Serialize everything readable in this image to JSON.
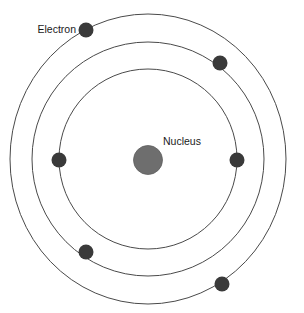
{
  "diagram": {
    "type": "atomic-structure-diagram",
    "canvas": {
      "width": 304,
      "height": 313,
      "background": "#ffffff"
    },
    "center": {
      "x": 148,
      "y": 159
    },
    "colors": {
      "orbit_stroke": "#4a4a4a",
      "nucleus_fill": "#6e6e6e",
      "nucleus_stroke": "#5f5f5f",
      "electron_fill": "#3a3a3a",
      "label_text": "#1a1a1a",
      "background": "#ffffff"
    },
    "labels": [
      {
        "id": "electron-label",
        "text": "Electron",
        "x": 76,
        "y": 30,
        "anchor": "end"
      },
      {
        "id": "nucleus-label",
        "text": "Nucleus",
        "x": 163,
        "y": 142,
        "anchor": "start"
      }
    ],
    "nucleus": {
      "label": "Nucleus",
      "cx": 148,
      "cy": 160,
      "r": 14.5
    },
    "orbits": [
      {
        "id": "orbit-inner",
        "name": "inner-shell",
        "rx": 89,
        "ry": 90,
        "stroke_width": 1.0
      },
      {
        "id": "orbit-middle",
        "name": "middle-shell",
        "rx": 116,
        "ry": 117,
        "stroke_width": 1.0
      },
      {
        "id": "orbit-outer",
        "name": "outer-shell",
        "rx": 138,
        "ry": 145,
        "stroke_width": 1.0
      }
    ],
    "electrons": [
      {
        "id": "electron-1",
        "label": "Electron",
        "orbit": "outer-shell",
        "cx": 86,
        "cy": 30,
        "r": 7.5
      },
      {
        "id": "electron-2",
        "label": "Electron",
        "orbit": "middle-shell",
        "cx": 220,
        "cy": 63,
        "r": 7.5
      },
      {
        "id": "electron-3",
        "label": "Electron",
        "orbit": "inner-shell",
        "cx": 59,
        "cy": 160,
        "r": 7.5
      },
      {
        "id": "electron-4",
        "label": "Electron",
        "orbit": "inner-shell",
        "cx": 237,
        "cy": 160,
        "r": 7.5
      },
      {
        "id": "electron-5",
        "label": "Electron",
        "orbit": "middle-shell",
        "cx": 86,
        "cy": 252,
        "r": 7.5
      },
      {
        "id": "electron-6",
        "label": "Electron",
        "orbit": "outer-shell",
        "cx": 222,
        "cy": 284,
        "r": 7.5
      }
    ]
  },
  "chart_data": {
    "type": "diagram",
    "xlabel": "",
    "ylabel": "",
    "legend": [
      "Electron",
      "Nucleus"
    ],
    "annotations": [
      "Electron",
      "Nucleus"
    ],
    "categories": [
      "inner-shell",
      "middle-shell",
      "outer-shell"
    ],
    "series": [
      {
        "name": "electrons per shell",
        "values": [
          2,
          2,
          2
        ]
      },
      {
        "name": "shell radius (px)",
        "values": [
          90,
          117,
          145
        ]
      }
    ],
    "total_electrons": 6,
    "nucleus_radius_px": 14.5,
    "grid": false
  }
}
